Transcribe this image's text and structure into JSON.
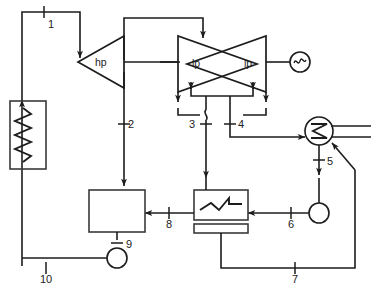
{
  "diagram": {
    "type": "process-flow-diagram",
    "colors": {
      "line": "#1c1c1c",
      "shape_outline": "#3a3a3a",
      "background": "#ffffff"
    },
    "components": [
      {
        "id": "boiler",
        "name": "steam-generator",
        "label": "",
        "shape": "rectangle-with-vertical-coil"
      },
      {
        "id": "hp-turbine",
        "name": "hp-turbine",
        "label": "hp",
        "shape": "triangle-left"
      },
      {
        "id": "lp-turbine-a",
        "name": "lp-turbine-left",
        "label": "lp",
        "shape": "triangle-crossed"
      },
      {
        "id": "lp-turbine-b",
        "name": "lp-turbine-right",
        "label": "lp",
        "shape": "triangle-crossed"
      },
      {
        "id": "generator",
        "name": "generator",
        "label": "",
        "shape": "circle-sine"
      },
      {
        "id": "condenser",
        "name": "condenser",
        "label": "",
        "shape": "circle-zigzag"
      },
      {
        "id": "deaerator",
        "name": "open-feedwater-heater",
        "label": "",
        "shape": "rectangle"
      },
      {
        "id": "cfwh",
        "name": "closed-feedwater-heater",
        "label": "",
        "shape": "rectangle-with-zigzag"
      },
      {
        "id": "pump-9",
        "name": "feedwater-pump",
        "label": "",
        "shape": "circle"
      },
      {
        "id": "pump-6",
        "name": "condensate-pump",
        "label": "",
        "shape": "circle"
      }
    ],
    "state_points": [
      {
        "id": 1,
        "label": "1",
        "x": 48,
        "y": 28,
        "tick": "vertical"
      },
      {
        "id": 2,
        "label": "2",
        "x": 128,
        "y": 128,
        "tick": "horizontal"
      },
      {
        "id": 3,
        "label": "3",
        "x": 200,
        "y": 128,
        "tick": "horizontal"
      },
      {
        "id": 4,
        "label": "4",
        "x": 243,
        "y": 128,
        "tick": "horizontal"
      },
      {
        "id": 5,
        "label": "5",
        "x": 329,
        "y": 166,
        "tick": "horizontal"
      },
      {
        "id": 6,
        "label": "6",
        "x": 296,
        "y": 213,
        "tick": "vertical"
      },
      {
        "id": 7,
        "label": "7",
        "x": 300,
        "y": 268,
        "tick": "vertical"
      },
      {
        "id": 8,
        "label": "8",
        "x": 174,
        "y": 213,
        "tick": "vertical"
      },
      {
        "id": 9,
        "label": "9",
        "x": 124,
        "y": 249,
        "tick": "horizontal"
      },
      {
        "id": 10,
        "label": "10",
        "x": 50,
        "y": 268,
        "tick": "vertical"
      }
    ],
    "turbine_labels": {
      "hp": "hp",
      "lp_left": "lp",
      "lp_right": "lp"
    }
  }
}
